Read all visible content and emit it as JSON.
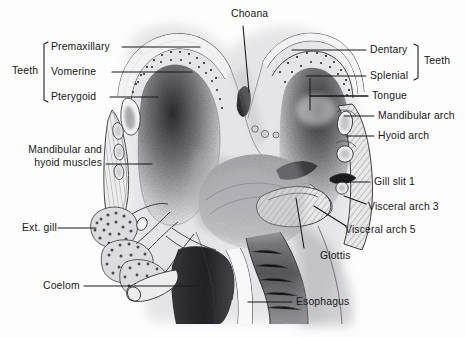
{
  "figure": {
    "background_color": "#fdfdfd",
    "ink_color": "#18181a",
    "width": 466,
    "height": 337
  },
  "labels": {
    "choana": "Choana",
    "teeth_left_group": "Teeth",
    "premaxillary": "Premaxillary",
    "vomerine": "Vomerine",
    "pterygoid": "Pterygoid",
    "mandibular_hyoid_muscles_line1": "Mandibular and",
    "mandibular_hyoid_muscles_line2": "hyoid muscles",
    "ext_gill": "Ext. gill",
    "coelom": "Coelom",
    "dentary": "Dentary",
    "splenial": "Splenial",
    "teeth_right_group": "Teeth",
    "tongue": "Tongue",
    "mandibular_arch": "Mandibular arch",
    "hyoid_arch": "Hyoid arch",
    "gill_slit_1": "Gill slit 1",
    "visceral_arch_3": "Visceral arch 3",
    "visceral_arch_5": "Visceral arch 5",
    "glottis": "Glottis",
    "esophagus": "Esophagus"
  }
}
